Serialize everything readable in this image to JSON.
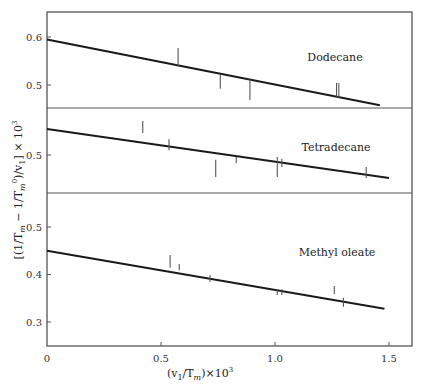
{
  "chart_data": {
    "type": "line",
    "title": "",
    "xlabel": "(v1/Tm) × 10^3",
    "ylabel": "[(1/Tm − 1/Tm^0)/v1] × 10^3",
    "xlim": [
      0,
      1.6
    ],
    "x_ticks": [
      0,
      0.5,
      1.0,
      1.5
    ],
    "x_tick_labels": [
      "0",
      "0.5",
      "1.0",
      "1.5"
    ],
    "grid": false,
    "legend": "none (panel text labels)",
    "panels": [
      {
        "name": "Dodecane",
        "ylim": [
          0.43,
          0.65
        ],
        "y_ticks": [
          0.5,
          0.6
        ],
        "y_tick_labels": [
          "0.5",
          "0.6"
        ],
        "fit_line": {
          "x": [
            0,
            1.46
          ],
          "y": [
            0.595,
            0.458
          ]
        },
        "error_bars": [
          {
            "x": 0.575,
            "ymin": 0.538,
            "ymax": 0.577
          },
          {
            "x": 0.76,
            "ymin": 0.492,
            "ymax": 0.521
          },
          {
            "x": 0.89,
            "ymin": 0.469,
            "ymax": 0.512
          },
          {
            "x": 1.27,
            "ymin": 0.473,
            "ymax": 0.504
          },
          {
            "x": 1.28,
            "ymin": 0.473,
            "ymax": 0.504
          }
        ]
      },
      {
        "name": "Tetradecane",
        "ylim": [
          0.42,
          0.6
        ],
        "y_ticks": [
          0.5
        ],
        "y_tick_labels": [
          "0.5"
        ],
        "fit_line": {
          "x": [
            0,
            1.5
          ],
          "y": [
            0.554,
            0.452
          ]
        },
        "error_bars": [
          {
            "x": 0.42,
            "ymin": 0.546,
            "ymax": 0.571
          },
          {
            "x": 0.535,
            "ymin": 0.51,
            "ymax": 0.533
          },
          {
            "x": 0.74,
            "ymin": 0.454,
            "ymax": 0.49
          },
          {
            "x": 0.83,
            "ymin": 0.483,
            "ymax": 0.496
          },
          {
            "x": 1.01,
            "ymin": 0.454,
            "ymax": 0.496
          },
          {
            "x": 1.03,
            "ymin": 0.475,
            "ymax": 0.492
          },
          {
            "x": 1.4,
            "ymin": 0.452,
            "ymax": 0.475
          }
        ]
      },
      {
        "name": "Methyl oleate",
        "ylim": [
          0.25,
          0.58
        ],
        "y_ticks": [
          0.3,
          0.4,
          0.5
        ],
        "y_tick_labels": [
          "0.3",
          "0.4",
          "0.5"
        ],
        "fit_line": {
          "x": [
            0,
            1.48
          ],
          "y": [
            0.45,
            0.328
          ]
        },
        "error_bars": [
          {
            "x": 0.54,
            "ymin": 0.414,
            "ymax": 0.441
          },
          {
            "x": 0.58,
            "ymin": 0.409,
            "ymax": 0.422
          },
          {
            "x": 0.715,
            "ymin": 0.384,
            "ymax": 0.399
          },
          {
            "x": 1.01,
            "ymin": 0.357,
            "ymax": 0.369
          },
          {
            "x": 1.03,
            "ymin": 0.357,
            "ymax": 0.369
          },
          {
            "x": 1.26,
            "ymin": 0.359,
            "ymax": 0.376
          },
          {
            "x": 1.3,
            "ymin": 0.332,
            "ymax": 0.351
          }
        ]
      }
    ]
  },
  "layout": {
    "frame": {
      "left": 47,
      "right": 412,
      "top": 12,
      "bottom": 346
    },
    "x_px_per_unit": 228,
    "panel_dividers_y": [
      108,
      193
    ],
    "panels_px": [
      {
        "ref_value": 0.6,
        "ref_y": 37,
        "px_per_unit": 480,
        "label_x": 335,
        "label_y": 61
      },
      {
        "ref_value": 0.5,
        "ref_y": 155,
        "px_per_unit": 480,
        "label_x": 336,
        "label_y": 151
      },
      {
        "ref_value": 0.5,
        "ref_y": 227,
        "px_per_unit": 475,
        "label_x": 337,
        "label_y": 256
      }
    ],
    "colors": {
      "frame": "#555555",
      "line": "#1a1a1a",
      "bars": "#555555",
      "text": "#333333"
    }
  },
  "labels": {
    "xlabel_main": "(v",
    "xlabel_sub": "1",
    "xlabel_mid": "/T",
    "xlabel_sub2": "m",
    "xlabel_tail": ")×10",
    "xlabel_sup": "3"
  }
}
